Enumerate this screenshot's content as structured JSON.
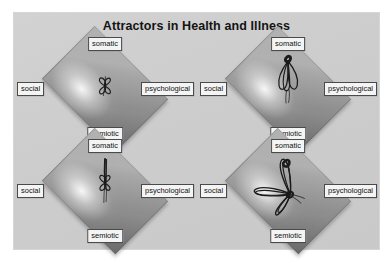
{
  "figure": {
    "title": "Attractors in Health and Illness",
    "background_color": "#ffffff",
    "panel_color": "#cfcfcf",
    "diamond_color": "#9c9c9c",
    "attractor_color": "#1b1b1b",
    "label_box_color": "#f4f4f4",
    "label_border_color": "#4a4a4a"
  },
  "poles": {
    "top": "somatic",
    "left": "social",
    "right": "psychological",
    "bottom": "semiotic"
  },
  "panels": [
    {
      "id": "top-left",
      "position": "top-left",
      "poles": {
        "top": "somatic",
        "left": "social",
        "right": "psychological",
        "bottom": "semiotic"
      },
      "attractor": {
        "name": "compact-balanced-attractor",
        "description": "small tight four-lobed attractor centered in the diamond",
        "size": "small",
        "bias": "centered"
      }
    },
    {
      "id": "top-right",
      "position": "top-right",
      "poles": {
        "top": "somatic",
        "left": "social",
        "right": "psychological",
        "bottom": "semiotic"
      },
      "attractor": {
        "name": "somatic-elongated-attractor",
        "description": "elongated attractor stretched upward toward the somatic pole",
        "size": "medium",
        "bias": "somatic"
      }
    },
    {
      "id": "bottom-left",
      "position": "bottom-left",
      "poles": {
        "top": "somatic",
        "left": "social",
        "right": "psychological",
        "bottom": "semiotic"
      },
      "attractor": {
        "name": "somatic-tethered-attractor",
        "description": "compact attractor with a narrow stem reaching up to the somatic pole",
        "size": "small",
        "bias": "somatic"
      }
    },
    {
      "id": "bottom-right",
      "position": "bottom-right",
      "poles": {
        "top": "somatic",
        "left": "social",
        "right": "psychological",
        "bottom": "semiotic"
      },
      "attractor": {
        "name": "wide-sprawling-attractor",
        "description": "large sprawling attractor spanning social, somatic and semiotic regions",
        "size": "large",
        "bias": "spread"
      }
    }
  ]
}
